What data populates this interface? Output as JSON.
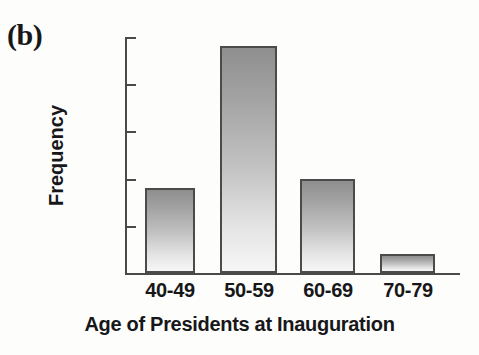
{
  "panel": {
    "label": "(b)"
  },
  "chart_data": {
    "type": "bar",
    "title": "",
    "subtitle": "",
    "xlabel": "Age of Presidents at Inauguration",
    "ylabel": "Frequency",
    "categories": [
      "40-49",
      "50-59",
      "60-69",
      "70-79"
    ],
    "values": [
      9,
      24,
      10,
      2
    ],
    "series": [
      {
        "name": "Frequency",
        "values": [
          9,
          24,
          10,
          2
        ]
      }
    ],
    "ylim": [
      0,
      25
    ],
    "yticks": [
      0,
      5,
      10,
      15,
      20,
      25
    ],
    "ytick_labels": [
      "0",
      "5",
      "10",
      "15",
      "20",
      "25"
    ],
    "xlim_categories": 4,
    "grid": false,
    "legend": false,
    "legend_position": "none",
    "bar_style": {
      "fill_top_color": "#8f8f8f",
      "fill_bottom_color": "#f6f6f6",
      "edge_color": "#4b4b4b"
    },
    "axis_color": "#4a4a4a",
    "text_color": "#17171a",
    "background_color": "#fdfdfc",
    "annotations": [
      "(b)"
    ]
  }
}
